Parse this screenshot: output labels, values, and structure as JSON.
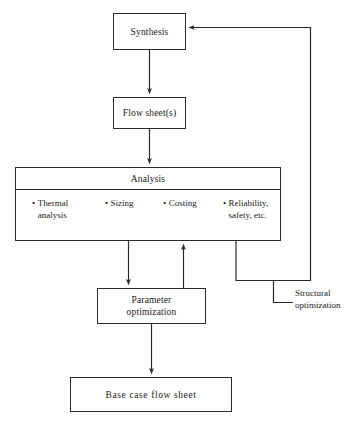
{
  "diagram": {
    "type": "flowchart",
    "background_color": "#ffffff",
    "line_color": "#2a2a2a",
    "text_color": "#1a1a1a"
  },
  "nodes": {
    "synthesis": {
      "label": "Synthesis"
    },
    "flowsheet": {
      "label": "Flow sheet(s)"
    },
    "analysis": {
      "header_label": "Analysis",
      "items": [
        {
          "bullet": "•",
          "text": "Thermal\nanalysis"
        },
        {
          "bullet": "•",
          "text": "Sizing"
        },
        {
          "bullet": "•",
          "text": "Costing"
        },
        {
          "bullet": "•",
          "text": "Reliability,\nsafety, etc."
        }
      ]
    },
    "parameter_optimization": {
      "label": "Parameter\noptimization"
    },
    "base_case_flow_sheet": {
      "label": "Base  case flow sheet"
    }
  },
  "annotations": {
    "structural_optimization": {
      "label": "Structural\noptimization"
    }
  },
  "edges": [
    {
      "name": "synthesis-to-flowsheet",
      "from": "synthesis",
      "to": "flowsheet",
      "arrow": true
    },
    {
      "name": "flowsheet-to-analysis",
      "from": "flowsheet",
      "to": "analysis",
      "arrow": true
    },
    {
      "name": "analysis-to-parameter-optimization",
      "from": "analysis",
      "to": "parameter_optimization",
      "arrow": true
    },
    {
      "name": "parameter-optimization-to-analysis",
      "from": "parameter_optimization",
      "to": "analysis",
      "arrow": true
    },
    {
      "name": "parameter-optimization-to-base-case",
      "from": "parameter_optimization",
      "to": "base_case_flow_sheet",
      "arrow": true
    },
    {
      "name": "analysis-to-synthesis-feedback",
      "from": "analysis",
      "to": "synthesis",
      "arrow": true,
      "annotation": "structural_optimization"
    }
  ]
}
